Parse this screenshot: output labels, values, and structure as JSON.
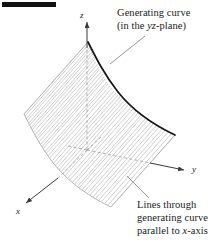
{
  "figure": {
    "background_color": "#ffffff",
    "corner_bar_color": "#111111"
  },
  "axes": {
    "z_label": "z",
    "y_label": "y",
    "x_label": "x",
    "origin_px": [
      87,
      150
    ],
    "axis_color": "#555555",
    "dashed_axis_color": "#9a9a9a"
  },
  "callouts": {
    "generating_curve": {
      "line1": "Generating curve",
      "line2_prefix": "(in the ",
      "line2_italic": "yz",
      "line2_suffix": "-plane)"
    },
    "lines_through": {
      "line1": "Lines through",
      "line2": "generating curve",
      "line3_prefix": "parallel to ",
      "line3_italic": "x",
      "line3_suffix": "-axis"
    }
  },
  "surface": {
    "hatch_color": "#b8b8b8",
    "outline_color": "#a8a8a8",
    "generating_curve_color": "#1a1a1a"
  }
}
